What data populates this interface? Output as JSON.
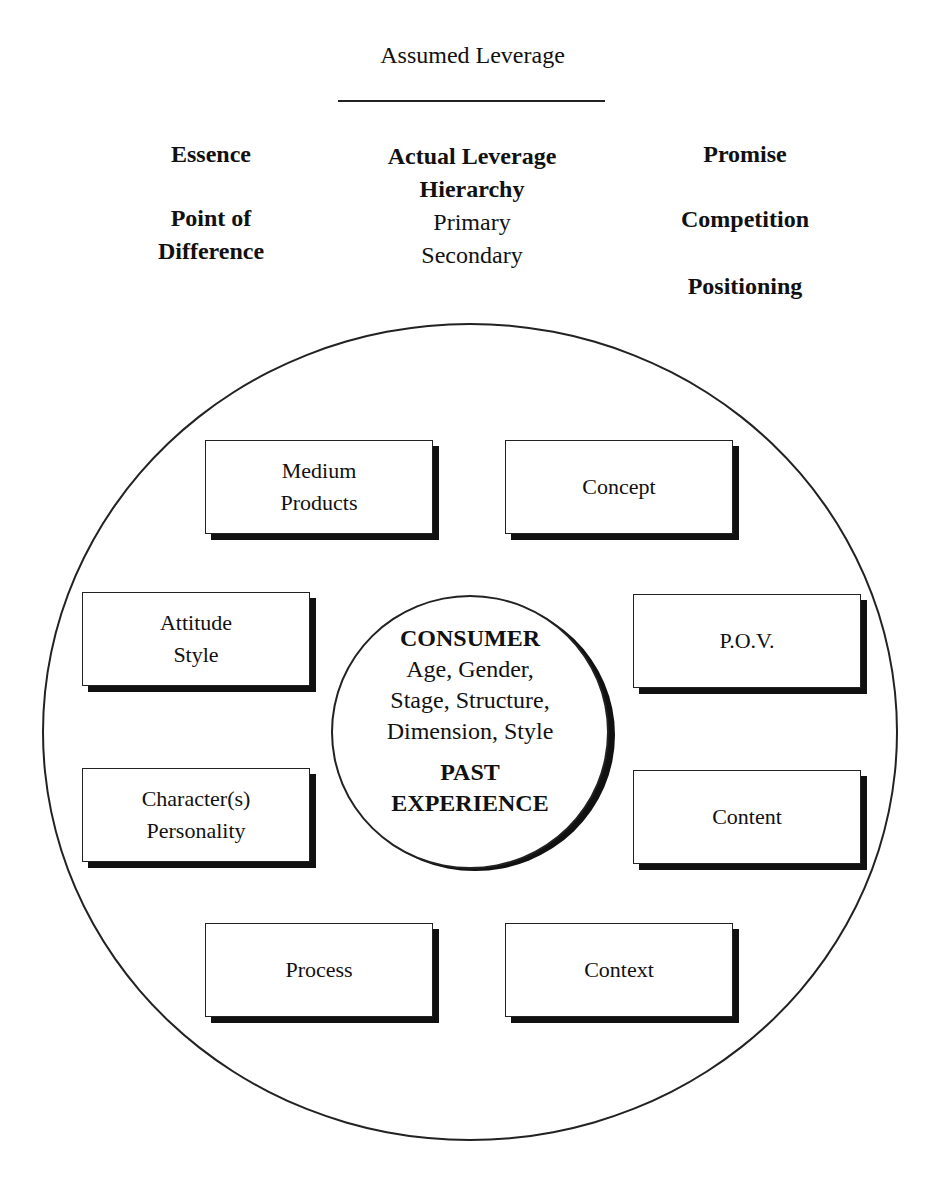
{
  "header": {
    "title": "Assumed Leverage"
  },
  "columns": {
    "left": {
      "items": [
        "Essence",
        "Point of",
        "Difference"
      ]
    },
    "center": {
      "heading_line1": "Actual Leverage",
      "heading_line2": "Hierarchy",
      "sub_items": [
        "Primary",
        "Secondary"
      ]
    },
    "right": {
      "items": [
        "Promise",
        "Competition",
        "Positioning"
      ]
    }
  },
  "core": {
    "title": "CONSUMER",
    "attributes": [
      "Age, Gender,",
      "Stage, Structure,",
      "Dimension, Style"
    ],
    "subtitle_line1": "PAST",
    "subtitle_line2": "EXPERIENCE"
  },
  "boxes": [
    {
      "lines": [
        "Medium",
        "Products"
      ]
    },
    {
      "lines": [
        "Concept"
      ]
    },
    {
      "lines": [
        "Attitude",
        "Style"
      ]
    },
    {
      "lines": [
        "P.O.V."
      ]
    },
    {
      "lines": [
        "Character(s)",
        "Personality"
      ]
    },
    {
      "lines": [
        "Content"
      ]
    },
    {
      "lines": [
        "Process"
      ]
    },
    {
      "lines": [
        "Context"
      ]
    }
  ],
  "colors": {
    "line": "#222222",
    "shadow": "#111111",
    "background": "#ffffff"
  }
}
